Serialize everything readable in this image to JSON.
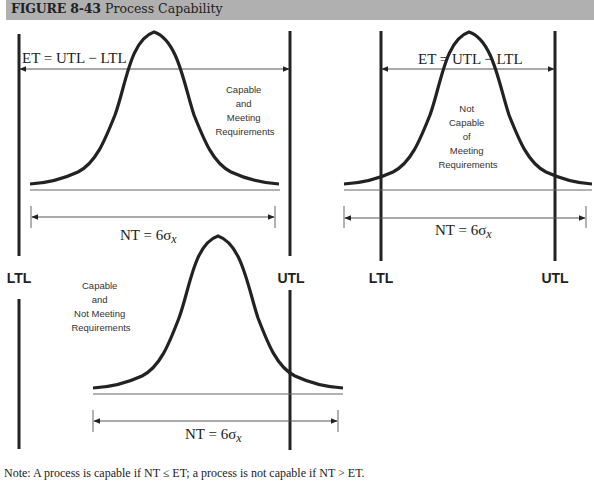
{
  "figure": {
    "number": "FIGURE 8-43",
    "title": "Process Capability",
    "header_color": "#b0b0b0"
  },
  "panels": [
    {
      "id": "capable-meeting",
      "et_label": "ET = UTL − LTL",
      "nt_label_main": "NT = 6σ",
      "nt_label_sub": "x",
      "status_lines": [
        "Capable",
        "and",
        "Meeting",
        "Requirements"
      ],
      "ltl_label": "LTL",
      "utl_label": "UTL"
    },
    {
      "id": "not-capable",
      "et_label": "ET = UTL − LTL",
      "nt_label_main": "NT = 6σ",
      "nt_label_sub": "x",
      "status_lines": [
        "Not",
        "Capable",
        "of",
        "Meeting",
        "Requirements"
      ],
      "ltl_label": "LTL",
      "utl_label": "UTL"
    },
    {
      "id": "capable-not-meeting",
      "nt_label_main": "NT = 6σ",
      "nt_label_sub": "x",
      "status_lines": [
        "Capable",
        "and",
        "Not Meeting",
        "Requirements"
      ]
    }
  ],
  "note": "Note: A process is capable if NT ≤ ET; a process is not capable if NT > ET."
}
